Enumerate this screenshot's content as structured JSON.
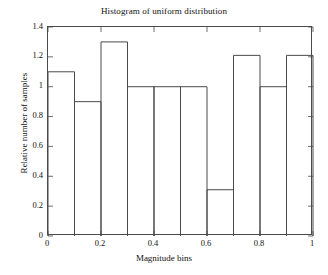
{
  "chart_data": {
    "type": "bar",
    "title": "Histogram of uniform distribution",
    "xlabel": "Magnitude bins",
    "ylabel": "Relative number of samples",
    "categories": [
      "0-0.1",
      "0.1-0.2",
      "0.2-0.3",
      "0.3-0.4",
      "0.4-0.5",
      "0.5-0.6",
      "0.6-0.7",
      "0.7-0.8",
      "0.8-0.9",
      "0.9-1"
    ],
    "bin_edges": [
      0,
      0.1,
      0.2,
      0.3,
      0.4,
      0.5,
      0.6,
      0.7,
      0.8,
      0.9,
      1
    ],
    "values": [
      1.1,
      0.9,
      1.3,
      1.0,
      1.0,
      1.0,
      0.31,
      1.21,
      1.0,
      1.21
    ],
    "xlim": [
      0,
      1
    ],
    "ylim": [
      0,
      1.4
    ],
    "x_ticks": [
      0,
      0.2,
      0.4,
      0.6,
      0.8,
      1
    ],
    "x_tick_labels": [
      "0",
      "0.2",
      "0.4",
      "0.6",
      "0.8",
      "1"
    ],
    "x_minor_ticks": [
      0.1,
      0.3,
      0.5,
      0.7,
      0.9
    ],
    "y_ticks": [
      0,
      0.2,
      0.4,
      0.6,
      0.8,
      1,
      1.2,
      1.4
    ],
    "y_tick_labels": [
      "0",
      "0.2",
      "0.4",
      "0.6",
      "0.8",
      "1",
      "1.2",
      "1.4"
    ],
    "grid": false,
    "legend": null,
    "bar_style": "outline",
    "bar_edge_color": "#4a4a4a",
    "bar_fill_color": "none",
    "axes_color": "#4a4a4a",
    "background_color": "#ffffff"
  }
}
